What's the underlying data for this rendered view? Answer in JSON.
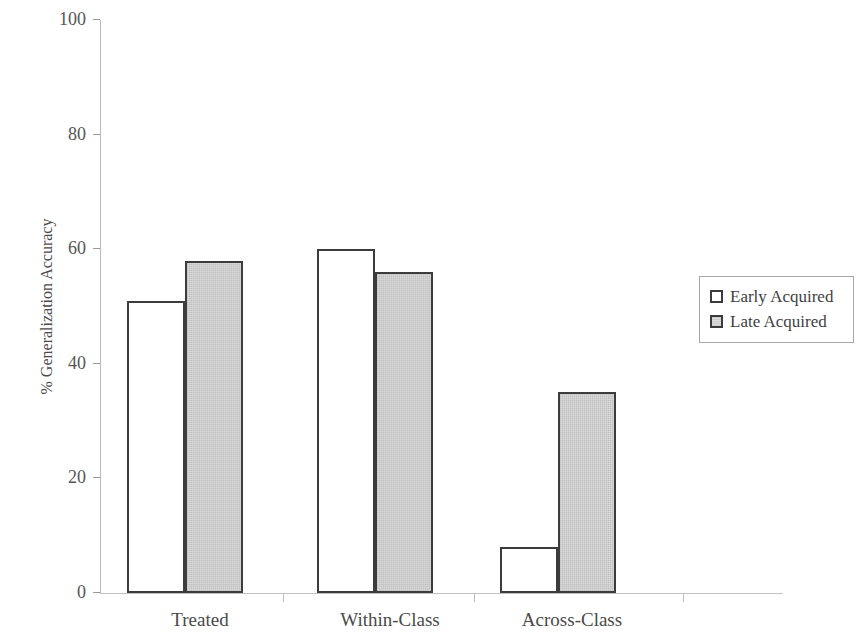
{
  "chart_data": {
    "type": "bar",
    "title": "",
    "xlabel": "",
    "ylabel": "% Generalization Accuracy",
    "categories": [
      "Treated",
      "Within-Class",
      "Across-Class"
    ],
    "series": [
      {
        "name": "Early Acquired",
        "values": [
          51,
          60,
          8
        ],
        "fill": "#ffffff",
        "stroke": "#3c3c3c"
      },
      {
        "name": "Late Acquired",
        "values": [
          58,
          56,
          35
        ],
        "fill": "#dcdcdc",
        "stroke": "#3c3c3c"
      }
    ],
    "ylim": [
      0,
      100
    ],
    "yticks": [
      0,
      20,
      40,
      60,
      80,
      100
    ],
    "ytick_labels": [
      "0",
      "20",
      "40",
      "60",
      "80",
      "100"
    ],
    "grid": false,
    "legend_position": "right"
  },
  "axes": {
    "y_title": "% Generalization Accuracy",
    "y_tick_0": "0",
    "y_tick_20": "20",
    "y_tick_40": "40",
    "y_tick_60": "60",
    "y_tick_80": "80",
    "y_tick_100": "100",
    "x_cat_0": "Treated",
    "x_cat_1": "Within-Class",
    "x_cat_2": "Across-Class"
  },
  "legend": {
    "items": [
      {
        "label": "Early Acquired",
        "swatch": "white-square-icon"
      },
      {
        "label": "Late Acquired",
        "swatch": "gray-square-icon"
      }
    ]
  }
}
